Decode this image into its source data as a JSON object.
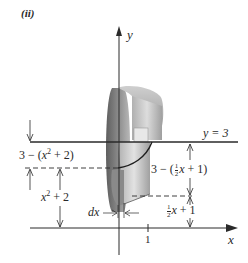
{
  "figure": {
    "panel_label": "(ii)",
    "axes": {
      "y_label": "y",
      "x_label": "x",
      "x_tick": "1"
    },
    "line_label": "y = 3",
    "annotations": {
      "outer_gap_left_prefix": "3 − (",
      "outer_gap_left_var": "x",
      "outer_gap_left_exp": "2",
      "outer_gap_left_suffix": " + 2)",
      "inner_left_var": "x",
      "inner_left_exp": "2",
      "inner_left_suffix": " + 2",
      "outer_gap_right_prefix": "3 − (",
      "outer_gap_right_frac_num": "1",
      "outer_gap_right_frac_den": "2",
      "outer_gap_right_var": "x",
      "outer_gap_right_suffix": " + 1)",
      "inner_right_frac_num": "1",
      "inner_right_frac_den": "2",
      "inner_right_var": "x",
      "inner_right_suffix": " + 1",
      "dx_label": "dx"
    },
    "colors": {
      "ink": "#2a2a2a",
      "solid_dark": "#6e6e6e",
      "solid_mid": "#9a9a9a",
      "solid_light": "#d4d4d4"
    }
  }
}
